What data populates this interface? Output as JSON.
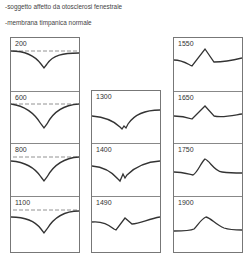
{
  "captions": [
    "-soggetto affetto da otosclerosi fenestrale",
    "-membrana timpanica normale"
  ],
  "columns": [
    {
      "panels": [
        {
          "label": "200",
          "dashed_reference": true
        },
        {
          "label": "600",
          "dashed_reference": true
        },
        {
          "label": "800",
          "dashed_reference": true
        },
        {
          "label": "1100",
          "dashed_reference": true
        }
      ]
    },
    {
      "panels": [
        {
          "label": "1300",
          "dashed_reference": false
        },
        {
          "label": "1400",
          "dashed_reference": false
        },
        {
          "label": "1490",
          "dashed_reference": false
        }
      ]
    },
    {
      "panels": [
        {
          "label": "1550",
          "dashed_reference": false
        },
        {
          "label": "1650",
          "dashed_reference": false
        },
        {
          "label": "1750",
          "dashed_reference": false
        },
        {
          "label": "1900",
          "dashed_reference": false
        }
      ]
    }
  ]
}
